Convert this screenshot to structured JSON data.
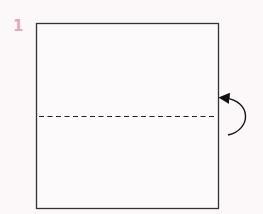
{
  "diagram": {
    "step_number": "1",
    "step_color": "#e4a9b8",
    "background": "#fcf8f9",
    "elements": [
      {
        "type": "square-paper",
        "x": 36,
        "y": 23,
        "width": 183,
        "height": 186
      },
      {
        "type": "valley-fold-line",
        "style": "dashed",
        "y": 116
      },
      {
        "type": "fold-arrow",
        "direction": "fold bottom half up behind / over",
        "side": "right"
      }
    ]
  }
}
